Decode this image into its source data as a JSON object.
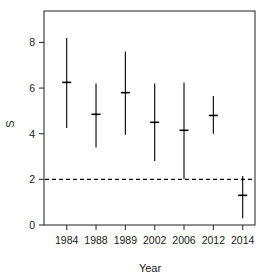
{
  "chart_data": {
    "type": "scatter",
    "title": "",
    "xlabel": "Year",
    "ylabel": "S",
    "categories": [
      "1984",
      "1988",
      "1989",
      "2002",
      "2006",
      "2012",
      "2014"
    ],
    "x_tick_labels": [
      "1984",
      "1988",
      "1989",
      "2002",
      "2006",
      "2012",
      "2014"
    ],
    "y_tick_labels": [
      "0",
      "2",
      "4",
      "6",
      "8"
    ],
    "y_ticks": [
      0,
      2,
      4,
      6,
      8
    ],
    "ylim": [
      -0.4,
      8.9
    ],
    "grid": false,
    "legend": null,
    "reference_line": {
      "name": "threshold-line",
      "value": 2,
      "style": "dashed",
      "color": "#000000"
    },
    "series": [
      {
        "name": "S estimate with range",
        "marker": "cross-tick",
        "color": "#000000",
        "points": [
          {
            "category": "1984",
            "value": 6.25,
            "low": 4.25,
            "high": 8.2
          },
          {
            "category": "1988",
            "value": 4.85,
            "low": 3.4,
            "high": 6.2
          },
          {
            "category": "1989",
            "value": 5.8,
            "low": 3.95,
            "high": 7.6
          },
          {
            "category": "2002",
            "value": 4.5,
            "low": 2.8,
            "high": 6.2
          },
          {
            "category": "2006",
            "value": 4.15,
            "low": 2.0,
            "high": 6.25
          },
          {
            "category": "2012",
            "value": 4.8,
            "low": 4.0,
            "high": 5.65
          },
          {
            "category": "2014",
            "value": 1.3,
            "low": 0.3,
            "high": 2.15
          }
        ]
      }
    ]
  },
  "axes": {
    "x_axis_label": "Year",
    "y_axis_label": "S"
  }
}
